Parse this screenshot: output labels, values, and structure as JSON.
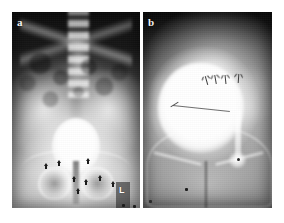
{
  "figure": {
    "kind": "radiograph-figure",
    "background_color": "#ffffff",
    "panel_count": 2
  },
  "panels": [
    {
      "id": "panel-a",
      "label": "a",
      "modality": "plain-radiograph",
      "region": "pelvis-and-lower-abdomen",
      "description": "Antero-posterior pelvic radiograph with contrast-filled urinary bladder seen as a bright ovoid opacity in the midline; lumbar spine, sacrum, iliac wings, obturator foramina and pubic symphysis visible; bowel gas mottling overlies the mid abdomen.",
      "bounds": {
        "x": 12,
        "y": 12,
        "width": 128,
        "height": 196
      },
      "annotations": {
        "arrowheads": [
          {
            "name": "arrowhead-1",
            "x": 32,
            "y": 151
          },
          {
            "name": "arrowhead-2",
            "x": 45,
            "y": 148
          },
          {
            "name": "arrowhead-3",
            "x": 74,
            "y": 146
          },
          {
            "name": "arrowhead-4",
            "x": 60,
            "y": 164
          },
          {
            "name": "arrowhead-5",
            "x": 72,
            "y": 167
          },
          {
            "name": "arrowhead-6",
            "x": 86,
            "y": 163
          },
          {
            "name": "arrowhead-7",
            "x": 64,
            "y": 176
          },
          {
            "name": "arrowhead-8",
            "x": 99,
            "y": 169
          }
        ],
        "side_marker": {
          "name": "radiopaque-side-marker",
          "text": "L",
          "x": 108,
          "y": 174
        },
        "marker_dots": [
          {
            "name": "marker-dot-1",
            "x": 110,
            "y": 192
          },
          {
            "name": "marker-dot-2",
            "x": 121,
            "y": 193
          }
        ]
      }
    },
    {
      "id": "panel-b",
      "label": "b",
      "modality": "cystogram",
      "region": "pelvis",
      "description": "Cystographic view showing a markedly distended, densely opacified bladder occupying most of the pelvis; thin radio-opaque catheter traverses the bladder and a column of contrast extends inferolaterally on the right; fine arrows indicate the superior bladder margin.",
      "bounds": {
        "x": 143,
        "y": 12,
        "width": 129,
        "height": 196
      },
      "annotations": {
        "line_arrows": [
          {
            "name": "line-arrow-1",
            "x": 63,
            "y": 64,
            "rotation": -16
          },
          {
            "name": "line-arrow-2",
            "x": 72,
            "y": 63,
            "rotation": -10
          },
          {
            "name": "line-arrow-3",
            "x": 82,
            "y": 63,
            "rotation": -6
          },
          {
            "name": "line-arrow-4",
            "x": 95,
            "y": 62,
            "rotation": 4
          }
        ],
        "marker_dots": [
          {
            "name": "marker-dot-b-1",
            "x": 42,
            "y": 176
          },
          {
            "name": "marker-dot-b-2",
            "x": 6,
            "y": 188
          }
        ]
      }
    }
  ],
  "colors": {
    "page_background": "#ffffff",
    "film_dark": "#101010",
    "film_mid": "#8e8e8e",
    "film_bright": "#ffffff",
    "annotation_dark": "#1b1b1b",
    "label_text": "#f2f2f2"
  }
}
